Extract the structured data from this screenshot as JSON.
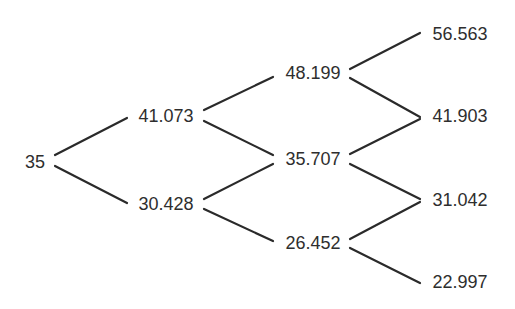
{
  "diagram": {
    "type": "binomial-tree",
    "levels": 4,
    "nodes": [
      {
        "id": "n0_0",
        "value": "35",
        "x": 35,
        "y": 162
      },
      {
        "id": "n1_0",
        "value": "41.073",
        "x": 166,
        "y": 116
      },
      {
        "id": "n1_1",
        "value": "30.428",
        "x": 166,
        "y": 204
      },
      {
        "id": "n2_0",
        "value": "48.199",
        "x": 313,
        "y": 73
      },
      {
        "id": "n2_1",
        "value": "35.707",
        "x": 313,
        "y": 159
      },
      {
        "id": "n2_2",
        "value": "26.452",
        "x": 313,
        "y": 243
      },
      {
        "id": "n3_0",
        "value": "56.563",
        "x": 460,
        "y": 34
      },
      {
        "id": "n3_1",
        "value": "41.903",
        "x": 460,
        "y": 116
      },
      {
        "id": "n3_2",
        "value": "31.042",
        "x": 460,
        "y": 200
      },
      {
        "id": "n3_3",
        "value": "22.997",
        "x": 460,
        "y": 282
      }
    ],
    "edges": [
      {
        "from": "n0_0",
        "to": "n1_0",
        "x1": 55,
        "y1": 155,
        "x2": 127,
        "y2": 118
      },
      {
        "from": "n0_0",
        "to": "n1_1",
        "x1": 55,
        "y1": 166,
        "x2": 127,
        "y2": 203
      },
      {
        "from": "n1_0",
        "to": "n2_0",
        "x1": 204,
        "y1": 110,
        "x2": 273,
        "y2": 77
      },
      {
        "from": "n1_0",
        "to": "n2_1",
        "x1": 204,
        "y1": 121,
        "x2": 273,
        "y2": 155
      },
      {
        "from": "n1_1",
        "to": "n2_1",
        "x1": 204,
        "y1": 199,
        "x2": 273,
        "y2": 164
      },
      {
        "from": "n1_1",
        "to": "n2_2",
        "x1": 204,
        "y1": 209,
        "x2": 273,
        "y2": 241
      },
      {
        "from": "n2_0",
        "to": "n3_0",
        "x1": 350,
        "y1": 69,
        "x2": 420,
        "y2": 33
      },
      {
        "from": "n2_0",
        "to": "n3_1",
        "x1": 350,
        "y1": 78,
        "x2": 420,
        "y2": 117
      },
      {
        "from": "n2_1",
        "to": "n3_1",
        "x1": 350,
        "y1": 154,
        "x2": 420,
        "y2": 119
      },
      {
        "from": "n2_1",
        "to": "n3_2",
        "x1": 350,
        "y1": 164,
        "x2": 420,
        "y2": 199
      },
      {
        "from": "n2_2",
        "to": "n3_2",
        "x1": 350,
        "y1": 239,
        "x2": 420,
        "y2": 202
      },
      {
        "from": "n2_2",
        "to": "n3_3",
        "x1": 350,
        "y1": 248,
        "x2": 420,
        "y2": 283
      }
    ],
    "colors": {
      "line": "#2a2a2a",
      "text": "#2e2e2e",
      "background": "#ffffff"
    }
  }
}
